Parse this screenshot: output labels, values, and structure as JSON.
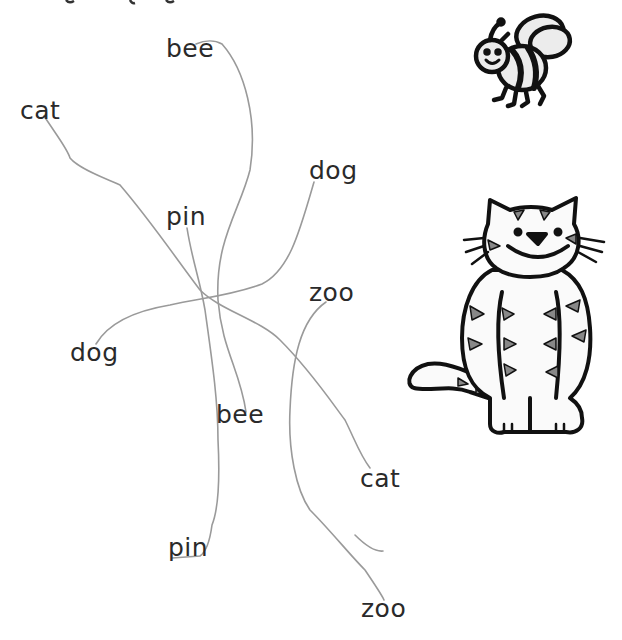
{
  "worksheet": {
    "left_words": [
      {
        "text": "bee",
        "x": 166,
        "y": 36
      },
      {
        "text": "cat",
        "x": 20,
        "y": 98
      },
      {
        "text": "pin",
        "x": 166,
        "y": 204
      },
      {
        "text": "dog",
        "x": 70,
        "y": 340
      }
    ],
    "right_words": [
      {
        "text": "dog",
        "x": 309,
        "y": 158
      },
      {
        "text": "zoo",
        "x": 309,
        "y": 280
      },
      {
        "text": "bee",
        "x": 216,
        "y": 402
      },
      {
        "text": "cat",
        "x": 360,
        "y": 466
      },
      {
        "text": "pin",
        "x": 168,
        "y": 535
      },
      {
        "text": "zoo",
        "x": 361,
        "y": 596
      }
    ],
    "pictures": [
      {
        "name": "bee",
        "x": 466,
        "y": 8
      },
      {
        "name": "cat",
        "x": 402,
        "y": 190
      }
    ],
    "line_color": "#9a9a9a",
    "text_color": "#2a2a2a"
  }
}
